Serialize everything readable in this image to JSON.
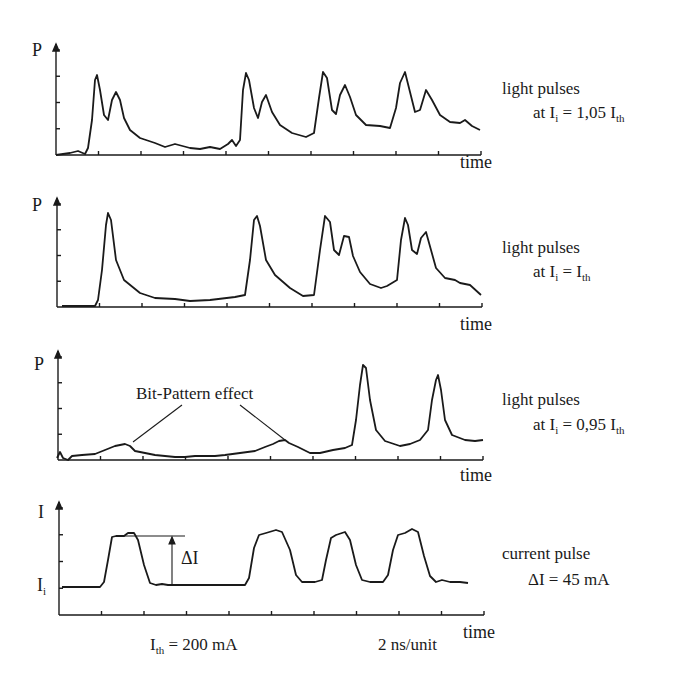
{
  "chart_data": [
    {
      "type": "line",
      "panel": 1,
      "ylabel": "P",
      "xlabel": "time",
      "annotation": {
        "line1": "light pulses",
        "line2_prefix": "at I",
        "line2_sub": "i",
        "line2_mid": " = 1,05 I",
        "line2_sub2": "th"
      },
      "x_ticks": 10,
      "y_ticks": 4,
      "description": "Double-peaked light pulses at four bit positions with slow decay tail",
      "points": [
        [
          56,
          155
        ],
        [
          70,
          153
        ],
        [
          78,
          151
        ],
        [
          85,
          154
        ],
        [
          88,
          148
        ],
        [
          92,
          120
        ],
        [
          95,
          80
        ],
        [
          97,
          75
        ],
        [
          100,
          90
        ],
        [
          104,
          115
        ],
        [
          108,
          120
        ],
        [
          112,
          100
        ],
        [
          116,
          92
        ],
        [
          120,
          100
        ],
        [
          124,
          118
        ],
        [
          130,
          130
        ],
        [
          140,
          138
        ],
        [
          155,
          143
        ],
        [
          165,
          147
        ],
        [
          175,
          144
        ],
        [
          190,
          148
        ],
        [
          200,
          149
        ],
        [
          210,
          147
        ],
        [
          220,
          149
        ],
        [
          228,
          144
        ],
        [
          232,
          140
        ],
        [
          236,
          146
        ],
        [
          240,
          140
        ],
        [
          243,
          90
        ],
        [
          246,
          73
        ],
        [
          249,
          80
        ],
        [
          254,
          108
        ],
        [
          258,
          118
        ],
        [
          262,
          102
        ],
        [
          266,
          95
        ],
        [
          272,
          112
        ],
        [
          280,
          125
        ],
        [
          292,
          133
        ],
        [
          306,
          137
        ],
        [
          314,
          133
        ],
        [
          319,
          98
        ],
        [
          323,
          72
        ],
        [
          327,
          78
        ],
        [
          332,
          110
        ],
        [
          336,
          114
        ],
        [
          340,
          95
        ],
        [
          345,
          85
        ],
        [
          350,
          97
        ],
        [
          356,
          115
        ],
        [
          366,
          125
        ],
        [
          380,
          126
        ],
        [
          390,
          128
        ],
        [
          396,
          108
        ],
        [
          400,
          83
        ],
        [
          405,
          72
        ],
        [
          410,
          92
        ],
        [
          415,
          112
        ],
        [
          420,
          110
        ],
        [
          426,
          90
        ],
        [
          432,
          100
        ],
        [
          440,
          115
        ],
        [
          450,
          122
        ],
        [
          460,
          123
        ],
        [
          465,
          120
        ],
        [
          472,
          126
        ],
        [
          480,
          130
        ]
      ]
    },
    {
      "type": "line",
      "panel": 2,
      "ylabel": "P",
      "xlabel": "time",
      "annotation": {
        "line1": "light pulses",
        "line2_prefix": "at I",
        "line2_sub": "i",
        "line2_mid": " = I",
        "line2_sub2": "th"
      },
      "x_ticks": 10,
      "y_ticks": 4,
      "description": "Single sharp peaks at first two bit positions, double peaks at later positions",
      "points": [
        [
          62,
          306
        ],
        [
          80,
          306
        ],
        [
          95,
          306
        ],
        [
          98,
          300
        ],
        [
          102,
          270
        ],
        [
          106,
          225
        ],
        [
          108,
          213
        ],
        [
          111,
          220
        ],
        [
          116,
          260
        ],
        [
          124,
          280
        ],
        [
          140,
          293
        ],
        [
          155,
          298
        ],
        [
          175,
          299
        ],
        [
          190,
          301
        ],
        [
          210,
          300
        ],
        [
          235,
          297
        ],
        [
          245,
          295
        ],
        [
          250,
          260
        ],
        [
          254,
          220
        ],
        [
          257,
          216
        ],
        [
          260,
          226
        ],
        [
          266,
          260
        ],
        [
          275,
          275
        ],
        [
          290,
          288
        ],
        [
          303,
          296
        ],
        [
          314,
          295
        ],
        [
          320,
          250
        ],
        [
          325,
          216
        ],
        [
          330,
          222
        ],
        [
          334,
          250
        ],
        [
          339,
          255
        ],
        [
          344,
          236
        ],
        [
          349,
          237
        ],
        [
          353,
          256
        ],
        [
          360,
          272
        ],
        [
          370,
          284
        ],
        [
          381,
          288
        ],
        [
          387,
          286
        ],
        [
          397,
          280
        ],
        [
          401,
          240
        ],
        [
          405,
          218
        ],
        [
          408,
          225
        ],
        [
          412,
          250
        ],
        [
          417,
          254
        ],
        [
          421,
          238
        ],
        [
          426,
          232
        ],
        [
          431,
          250
        ],
        [
          436,
          268
        ],
        [
          445,
          278
        ],
        [
          455,
          280
        ],
        [
          460,
          283
        ],
        [
          470,
          285
        ],
        [
          481,
          295
        ]
      ]
    },
    {
      "type": "line",
      "panel": 3,
      "ylabel": "P",
      "xlabel": "time",
      "annotation": {
        "line1": "light pulses",
        "line2_prefix": "at I",
        "line2_sub": "i",
        "line2_mid": " = 0,95 I",
        "line2_sub2": "th"
      },
      "callout": "Bit-Pattern effect",
      "x_ticks": 10,
      "y_ticks": 4,
      "description": "Weak bit-pattern bumps at early positions, two isolated large peaks near the end",
      "points": [
        [
          57,
          458
        ],
        [
          60,
          452
        ],
        [
          63,
          458
        ],
        [
          68,
          460
        ],
        [
          72,
          456
        ],
        [
          82,
          455
        ],
        [
          95,
          454
        ],
        [
          105,
          450
        ],
        [
          115,
          446
        ],
        [
          120,
          445
        ],
        [
          125,
          444
        ],
        [
          130,
          446
        ],
        [
          135,
          451
        ],
        [
          145,
          453
        ],
        [
          155,
          455
        ],
        [
          165,
          456
        ],
        [
          175,
          457
        ],
        [
          185,
          457
        ],
        [
          195,
          456
        ],
        [
          205,
          456
        ],
        [
          215,
          456
        ],
        [
          225,
          455
        ],
        [
          240,
          453
        ],
        [
          255,
          451
        ],
        [
          265,
          447
        ],
        [
          273,
          444
        ],
        [
          279,
          441
        ],
        [
          285,
          440
        ],
        [
          289,
          443
        ],
        [
          298,
          447
        ],
        [
          310,
          453
        ],
        [
          320,
          453
        ],
        [
          333,
          450
        ],
        [
          345,
          448
        ],
        [
          352,
          445
        ],
        [
          356,
          420
        ],
        [
          360,
          385
        ],
        [
          363,
          365
        ],
        [
          366,
          368
        ],
        [
          370,
          400
        ],
        [
          376,
          430
        ],
        [
          385,
          441
        ],
        [
          400,
          446
        ],
        [
          410,
          444
        ],
        [
          420,
          440
        ],
        [
          428,
          430
        ],
        [
          432,
          400
        ],
        [
          436,
          380
        ],
        [
          438,
          375
        ],
        [
          441,
          390
        ],
        [
          445,
          420
        ],
        [
          452,
          435
        ],
        [
          465,
          440
        ],
        [
          475,
          441
        ],
        [
          483,
          440
        ]
      ]
    },
    {
      "type": "line",
      "panel": 4,
      "ylabel": "I",
      "baseline_label_prefix": "I",
      "baseline_label_sub": "i",
      "xlabel": "time",
      "annotation": {
        "line1": "current pulse",
        "line2": "ΔI = 45 mA"
      },
      "delta_label": "ΔI",
      "footer_left_prefix": "I",
      "footer_left_sub": "th",
      "footer_left_value": " = 200 mA",
      "footer_right": "2 ns/unit",
      "x_ticks": 10,
      "y_ticks": 4,
      "description": "Square current pulses of amplitude ΔI = 45 mA above bias Ii; Ith = 200 mA; 2 ns per division",
      "points": [
        [
          62,
          587
        ],
        [
          100,
          587
        ],
        [
          104,
          582
        ],
        [
          108,
          560
        ],
        [
          112,
          537
        ],
        [
          116,
          536
        ],
        [
          124,
          536
        ],
        [
          128,
          533
        ],
        [
          134,
          533
        ],
        [
          138,
          540
        ],
        [
          144,
          565
        ],
        [
          150,
          583
        ],
        [
          156,
          585
        ],
        [
          162,
          584
        ],
        [
          168,
          585
        ],
        [
          200,
          585
        ],
        [
          230,
          585
        ],
        [
          245,
          585
        ],
        [
          249,
          578
        ],
        [
          254,
          548
        ],
        [
          259,
          535
        ],
        [
          266,
          533
        ],
        [
          276,
          530
        ],
        [
          282,
          532
        ],
        [
          290,
          550
        ],
        [
          296,
          575
        ],
        [
          302,
          582
        ],
        [
          315,
          582
        ],
        [
          322,
          580
        ],
        [
          326,
          560
        ],
        [
          331,
          538
        ],
        [
          336,
          535
        ],
        [
          345,
          532
        ],
        [
          350,
          540
        ],
        [
          356,
          565
        ],
        [
          362,
          580
        ],
        [
          370,
          582
        ],
        [
          383,
          582
        ],
        [
          388,
          575
        ],
        [
          393,
          550
        ],
        [
          398,
          535
        ],
        [
          405,
          533
        ],
        [
          412,
          529
        ],
        [
          418,
          532
        ],
        [
          424,
          556
        ],
        [
          430,
          576
        ],
        [
          436,
          582
        ],
        [
          442,
          580
        ],
        [
          450,
          582
        ],
        [
          460,
          582
        ],
        [
          468,
          583
        ]
      ]
    }
  ],
  "labels": {
    "p1": {
      "y": "P",
      "x": "time"
    },
    "p2": {
      "y": "P",
      "x": "time"
    },
    "p3": {
      "y": "P",
      "x": "time"
    },
    "p4": {
      "y": "I",
      "x": "time",
      "base": "I",
      "base_sub": "i"
    }
  }
}
